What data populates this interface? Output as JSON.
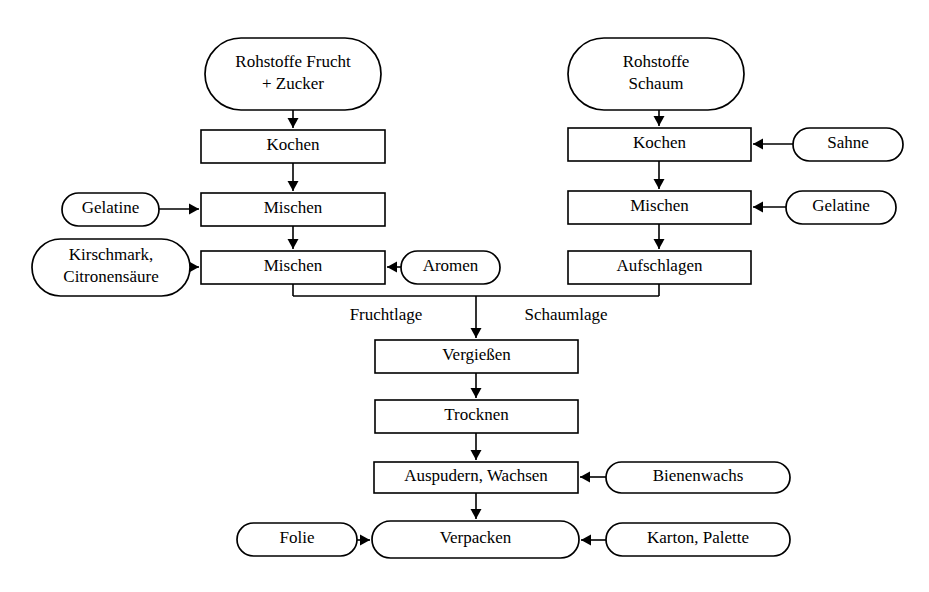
{
  "diagram": {
    "type": "flowchart",
    "orientation": "top-to-bottom",
    "stroke_color": "#000000",
    "fill_color": "#ffffff",
    "background_color": "#ffffff",
    "nodes": [
      {
        "id": "rohstoffe-frucht",
        "shape": "stadium",
        "role": "material-input",
        "lines": [
          "Rohstoffe Frucht",
          "+ Zucker"
        ],
        "x": 205,
        "y": 38,
        "w": 176,
        "h": 72
      },
      {
        "id": "rohstoffe-schaum",
        "shape": "stadium",
        "role": "material-input",
        "lines": [
          "Rohstoffe",
          "Schaum"
        ],
        "x": 568,
        "y": 38,
        "w": 176,
        "h": 72
      },
      {
        "id": "kochen-frucht",
        "shape": "rect",
        "role": "process",
        "lines": [
          "Kochen"
        ],
        "x": 201,
        "y": 130,
        "w": 184,
        "h": 33
      },
      {
        "id": "kochen-schaum",
        "shape": "rect",
        "role": "process",
        "lines": [
          "Kochen"
        ],
        "x": 568,
        "y": 128,
        "w": 183,
        "h": 33
      },
      {
        "id": "sahne",
        "shape": "stadium",
        "role": "material-input",
        "lines": [
          "Sahne"
        ],
        "x": 793,
        "y": 128,
        "w": 110,
        "h": 33
      },
      {
        "id": "mischen-frucht-1",
        "shape": "rect",
        "role": "process",
        "lines": [
          "Mischen"
        ],
        "x": 201,
        "y": 193,
        "w": 184,
        "h": 33
      },
      {
        "id": "gelatine-links",
        "shape": "stadium",
        "role": "material-input",
        "lines": [
          "Gelatine"
        ],
        "x": 62,
        "y": 193,
        "w": 97,
        "h": 33
      },
      {
        "id": "mischen-schaum",
        "shape": "rect",
        "role": "process",
        "lines": [
          "Mischen"
        ],
        "x": 568,
        "y": 191,
        "w": 183,
        "h": 33
      },
      {
        "id": "gelatine-rechts",
        "shape": "stadium",
        "role": "material-input",
        "lines": [
          "Gelatine"
        ],
        "x": 786,
        "y": 191,
        "w": 110,
        "h": 33
      },
      {
        "id": "mischen-frucht-2",
        "shape": "rect",
        "role": "process",
        "lines": [
          "Mischen"
        ],
        "x": 201,
        "y": 251,
        "w": 184,
        "h": 33
      },
      {
        "id": "kirschmark",
        "shape": "stadium",
        "role": "material-input",
        "lines": [
          "Kirschmark,",
          "Citronensäure"
        ],
        "x": 32,
        "y": 239,
        "w": 158,
        "h": 57
      },
      {
        "id": "aromen",
        "shape": "stadium",
        "role": "material-input",
        "lines": [
          "Aromen"
        ],
        "x": 401,
        "y": 251,
        "w": 99,
        "h": 33
      },
      {
        "id": "aufschlagen",
        "shape": "rect",
        "role": "process",
        "lines": [
          "Aufschlagen"
        ],
        "x": 568,
        "y": 251,
        "w": 183,
        "h": 33
      },
      {
        "id": "vergiessen",
        "shape": "rect",
        "role": "process",
        "lines": [
          "Vergießen"
        ],
        "x": 375,
        "y": 340,
        "w": 203,
        "h": 33
      },
      {
        "id": "trocknen",
        "shape": "rect",
        "role": "process",
        "lines": [
          "Trocknen"
        ],
        "x": 375,
        "y": 400,
        "w": 203,
        "h": 33
      },
      {
        "id": "auspudern-wachsen",
        "shape": "rect",
        "role": "process",
        "lines": [
          "Auspudern, Wachsen"
        ],
        "x": 374,
        "y": 462,
        "w": 204,
        "h": 31
      },
      {
        "id": "bienenwachs",
        "shape": "stadium",
        "role": "material-input",
        "lines": [
          "Bienenwachs"
        ],
        "x": 606,
        "y": 462,
        "w": 184,
        "h": 31
      },
      {
        "id": "verpacken",
        "shape": "stadium",
        "role": "process",
        "lines": [
          "Verpacken"
        ],
        "x": 372,
        "y": 521,
        "w": 207,
        "h": 37
      },
      {
        "id": "folie",
        "shape": "stadium",
        "role": "material-input",
        "lines": [
          "Folie"
        ],
        "x": 237,
        "y": 523,
        "w": 120,
        "h": 33
      },
      {
        "id": "karton-palette",
        "shape": "stadium",
        "role": "material-input",
        "lines": [
          "Karton, Palette"
        ],
        "x": 606,
        "y": 523,
        "w": 184,
        "h": 33
      }
    ],
    "edge_labels": [
      {
        "id": "fruchtlage",
        "text": "Fruchtlage",
        "x": 386,
        "y": 316
      },
      {
        "id": "schaumlage",
        "text": "Schaumlage",
        "x": 566,
        "y": 316
      }
    ],
    "edges": [
      {
        "id": "edge-rohstoffe-frucht-kochen",
        "from": "rohstoffe-frucht",
        "to": "kochen-frucht",
        "kind": "vertical-arrow",
        "points": [
          [
            293,
            110
          ],
          [
            293,
            128
          ]
        ]
      },
      {
        "id": "edge-kochen-frucht-mischen1",
        "from": "kochen-frucht",
        "to": "mischen-frucht-1",
        "kind": "vertical-arrow",
        "points": [
          [
            293,
            163
          ],
          [
            293,
            191
          ]
        ]
      },
      {
        "id": "edge-mischen1-mischen2",
        "from": "mischen-frucht-1",
        "to": "mischen-frucht-2",
        "kind": "vertical-arrow",
        "points": [
          [
            293,
            226
          ],
          [
            293,
            249
          ]
        ]
      },
      {
        "id": "edge-gelatine-links-mischen1",
        "from": "gelatine-links",
        "to": "mischen-frucht-1",
        "kind": "horizontal-arrow-right",
        "points": [
          [
            159,
            209
          ],
          [
            199,
            209
          ]
        ]
      },
      {
        "id": "edge-kirschmark-mischen2",
        "from": "kirschmark",
        "to": "mischen-frucht-2",
        "kind": "horizontal-arrow-right",
        "points": [
          [
            190,
            267
          ],
          [
            199,
            267
          ]
        ]
      },
      {
        "id": "edge-aromen-mischen2",
        "from": "aromen",
        "to": "mischen-frucht-2",
        "kind": "horizontal-arrow-left",
        "points": [
          [
            401,
            267
          ],
          [
            387,
            267
          ]
        ]
      },
      {
        "id": "edge-rohstoffe-schaum-kochen",
        "from": "rohstoffe-schaum",
        "to": "kochen-schaum",
        "kind": "vertical-arrow",
        "points": [
          [
            659,
            110
          ],
          [
            659,
            126
          ]
        ]
      },
      {
        "id": "edge-kochen-schaum-mischen",
        "from": "kochen-schaum",
        "to": "mischen-schaum",
        "kind": "vertical-arrow",
        "points": [
          [
            659,
            161
          ],
          [
            659,
            189
          ]
        ]
      },
      {
        "id": "edge-mischen-schaum-aufschlagen",
        "from": "mischen-schaum",
        "to": "aufschlagen",
        "kind": "vertical-arrow",
        "points": [
          [
            659,
            224
          ],
          [
            659,
            249
          ]
        ]
      },
      {
        "id": "edge-sahne-kochen-schaum",
        "from": "sahne",
        "to": "kochen-schaum",
        "kind": "horizontal-arrow-left",
        "points": [
          [
            793,
            144
          ],
          [
            753,
            144
          ]
        ]
      },
      {
        "id": "edge-gelatine-rechts-mischen",
        "from": "gelatine-rechts",
        "to": "mischen-schaum",
        "kind": "horizontal-arrow-left",
        "points": [
          [
            786,
            207
          ],
          [
            753,
            207
          ]
        ]
      },
      {
        "id": "edge-merge-fruchtlage",
        "from": "mischen-frucht-2",
        "to": "merge-bar",
        "kind": "elbow",
        "points": [
          [
            293,
            284
          ],
          [
            293,
            296
          ]
        ]
      },
      {
        "id": "edge-merge-schaumlage",
        "from": "aufschlagen",
        "to": "merge-bar",
        "kind": "elbow",
        "points": [
          [
            659,
            284
          ],
          [
            659,
            296
          ]
        ]
      },
      {
        "id": "edge-merge-bar",
        "from": "merge-bar",
        "to": "merge-bar",
        "kind": "horizontal-line",
        "points": [
          [
            293,
            296
          ],
          [
            659,
            296
          ]
        ]
      },
      {
        "id": "edge-merge-vergiessen",
        "from": "merge-bar",
        "to": "vergiessen",
        "kind": "vertical-arrow",
        "points": [
          [
            476,
            296
          ],
          [
            476,
            338
          ]
        ]
      },
      {
        "id": "edge-vergiessen-trocknen",
        "from": "vergiessen",
        "to": "trocknen",
        "kind": "vertical-arrow",
        "points": [
          [
            476,
            373
          ],
          [
            476,
            398
          ]
        ]
      },
      {
        "id": "edge-trocknen-auspudern",
        "from": "trocknen",
        "to": "auspudern-wachsen",
        "kind": "vertical-arrow",
        "points": [
          [
            476,
            433
          ],
          [
            476,
            460
          ]
        ]
      },
      {
        "id": "edge-auspudern-verpacken",
        "from": "auspudern-wachsen",
        "to": "verpacken",
        "kind": "vertical-arrow",
        "points": [
          [
            476,
            493
          ],
          [
            476,
            519
          ]
        ]
      },
      {
        "id": "edge-bienenwachs-auspudern",
        "from": "bienenwachs",
        "to": "auspudern-wachsen",
        "kind": "horizontal-arrow-left",
        "points": [
          [
            606,
            477
          ],
          [
            580,
            477
          ]
        ]
      },
      {
        "id": "edge-folie-verpacken",
        "from": "folie",
        "to": "verpacken",
        "kind": "horizontal-arrow-right",
        "points": [
          [
            357,
            540
          ],
          [
            370,
            540
          ]
        ]
      },
      {
        "id": "edge-karton-verpacken",
        "from": "karton-palette",
        "to": "verpacken",
        "kind": "horizontal-arrow-left",
        "points": [
          [
            606,
            540
          ],
          [
            581,
            540
          ]
        ]
      }
    ]
  }
}
